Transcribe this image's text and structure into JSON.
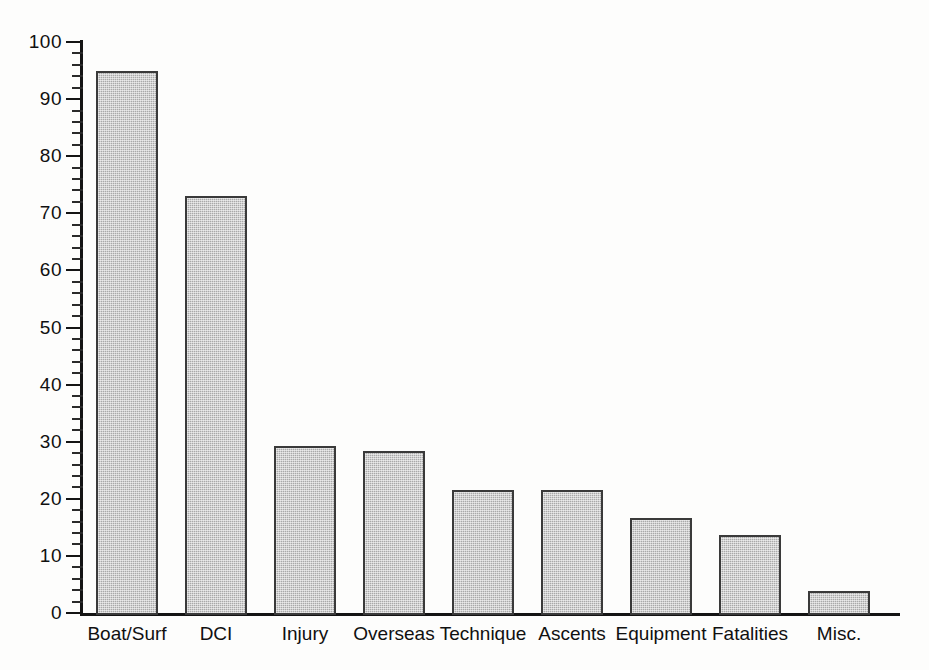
{
  "chart_data": {
    "type": "bar",
    "title": "",
    "subtitle": "",
    "xlabel": "",
    "ylabel": "",
    "categories": [
      "Boat/Surf",
      "DCI",
      "Injury",
      "Overseas",
      "Technique",
      "Ascents",
      "Equipment",
      "Fatalities",
      "Misc."
    ],
    "values": [
      95,
      73,
      29.3,
      28.3,
      21.5,
      21.5,
      16.6,
      13.7,
      3.9
    ],
    "ylim": [
      0,
      100
    ],
    "y_major_ticks": [
      0,
      10,
      20,
      30,
      40,
      50,
      60,
      70,
      80,
      90,
      100
    ],
    "y_major_tick_labels": [
      "0",
      "10",
      "20",
      "30",
      "40",
      "50",
      "60",
      "70",
      "80",
      "90",
      "100"
    ],
    "y_minor_tick_interval": 2,
    "grid": false,
    "legend": null,
    "legend_position": "none",
    "bar_fill_color": "#a9a9a9",
    "bar_edge_color": "#3a3a3a",
    "axis_color": "#141414",
    "background_color": "#fdfdfc"
  }
}
